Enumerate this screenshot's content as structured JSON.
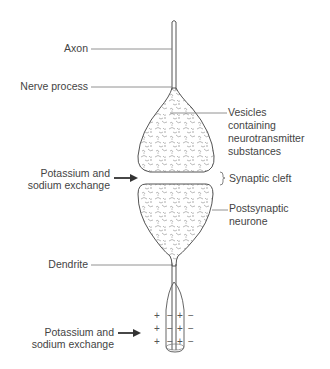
{
  "diagram": {
    "type": "synapse-anatomy",
    "labels": {
      "axon": "Axon",
      "nerve_process": "Nerve process",
      "vesicles": [
        "Vesicles",
        "containing",
        "neurotransmitter",
        "substances"
      ],
      "exchange_top": [
        "Potassium and",
        "sodium exchange"
      ],
      "synaptic_cleft": "Synaptic cleft",
      "postsynaptic": [
        "Postsynaptic",
        "neurone"
      ],
      "dendrite": "Dendrite",
      "exchange_bottom": [
        "Potassium and",
        "sodium exchange"
      ]
    },
    "charges": {
      "rows": 3,
      "pattern": [
        "+",
        "−",
        "+",
        "−"
      ]
    },
    "colors": {
      "stroke": "#555555",
      "label": "#444444",
      "texture": "#8a8a8a"
    }
  }
}
